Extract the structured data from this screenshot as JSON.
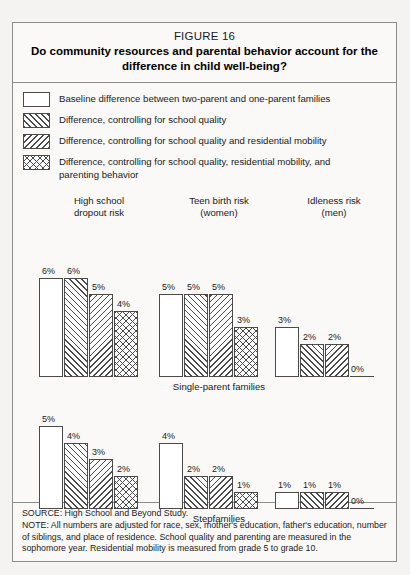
{
  "figure": {
    "number": "FIGURE 16",
    "title": "Do community resources and parental behavior account for the difference in child well-being?"
  },
  "legend": [
    {
      "pattern": "blank",
      "label": "Baseline difference between two-parent and one-parent families"
    },
    {
      "pattern": "forward-diagonal",
      "label": "Difference, controlling for school quality"
    },
    {
      "pattern": "backward-diagonal",
      "label": "Difference, controlling for school quality and residential mobility"
    },
    {
      "pattern": "crosshatch",
      "label": "Difference, controlling for school quality, residential mobility, and parenting behavior"
    }
  ],
  "panels": [
    {
      "line1": "High school",
      "line2": "dropout risk"
    },
    {
      "line1": "Teen birth risk",
      "line2": "(women)"
    },
    {
      "line1": "Idleness risk",
      "line2": "(men)"
    }
  ],
  "rows": [
    {
      "label": "Single-parent families"
    },
    {
      "label": "Stepfamilies"
    }
  ],
  "footer": {
    "source": "SOURCE: High School and Beyond Study.",
    "note": "NOTE: All numbers are adjusted for race, sex, mother's education, father's education, number of siblings, and place of residence. School quality and parenting are measured in the sophomore year. Residential mobility is measured from grade 5 to grade 10."
  },
  "chart_data": {
    "type": "bar",
    "title": "Do community resources and parental behavior account for the difference in child well-being?",
    "figure_number": "FIGURE 16",
    "unit": "percent",
    "ylabel": "",
    "xlabel": "",
    "grid": false,
    "legend_position": "top",
    "series": [
      {
        "name": "Baseline difference between two-parent and one-parent families",
        "pattern": "blank"
      },
      {
        "name": "Difference, controlling for school quality",
        "pattern": "forward-diagonal"
      },
      {
        "name": "Difference, controlling for school quality and residential mobility",
        "pattern": "backward-diagonal"
      },
      {
        "name": "Difference, controlling for school quality, residential mobility, and parenting behavior",
        "pattern": "crosshatch"
      }
    ],
    "panels": [
      {
        "family_type": "Single-parent families",
        "outcomes": [
          {
            "outcome": "High school dropout risk",
            "values": [
              6,
              6,
              5,
              4
            ],
            "labels": [
              "6%",
              "6%",
              "5%",
              "4%"
            ]
          },
          {
            "outcome": "Teen birth risk (women)",
            "values": [
              5,
              5,
              5,
              3
            ],
            "labels": [
              "5%",
              "5%",
              "5%",
              "3%"
            ]
          },
          {
            "outcome": "Idleness risk (men)",
            "values": [
              3,
              2,
              2,
              0
            ],
            "labels": [
              "3%",
              "2%",
              "2%",
              "0%"
            ]
          }
        ]
      },
      {
        "family_type": "Stepfamilies",
        "outcomes": [
          {
            "outcome": "High school dropout risk",
            "values": [
              5,
              4,
              3,
              2
            ],
            "labels": [
              "5%",
              "4%",
              "3%",
              "2%"
            ]
          },
          {
            "outcome": "Teen birth risk (women)",
            "values": [
              4,
              2,
              2,
              1
            ],
            "labels": [
              "4%",
              "2%",
              "2%",
              "1%"
            ]
          },
          {
            "outcome": "Idleness risk (men)",
            "values": [
              1,
              1,
              1,
              0
            ],
            "labels": [
              "1%",
              "1%",
              "1%",
              "0%"
            ]
          }
        ]
      }
    ]
  }
}
